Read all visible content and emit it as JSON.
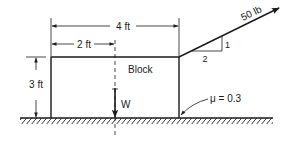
{
  "diagram": {
    "type": "statics-free-body-problem",
    "block_label": "Block",
    "dimensions": {
      "total_width": "4 ft",
      "half_width": "2 ft",
      "height": "3 ft"
    },
    "force": {
      "label": "50 lb",
      "slope_rise": "1",
      "slope_run": "2"
    },
    "weight_label": "W",
    "friction_label": "μ = 0.3"
  },
  "colors": {
    "ink": "#1a1a1a",
    "background": "#ffffff"
  }
}
